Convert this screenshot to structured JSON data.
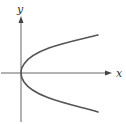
{
  "diagram": {
    "x_axis_label": "x",
    "y_axis_label": "y",
    "curve": {
      "type": "parabola",
      "orientation": "opens-right",
      "vertex": "origin"
    },
    "colors": {
      "axis": "#555555",
      "curve": "#555555",
      "label": "#333333"
    }
  }
}
